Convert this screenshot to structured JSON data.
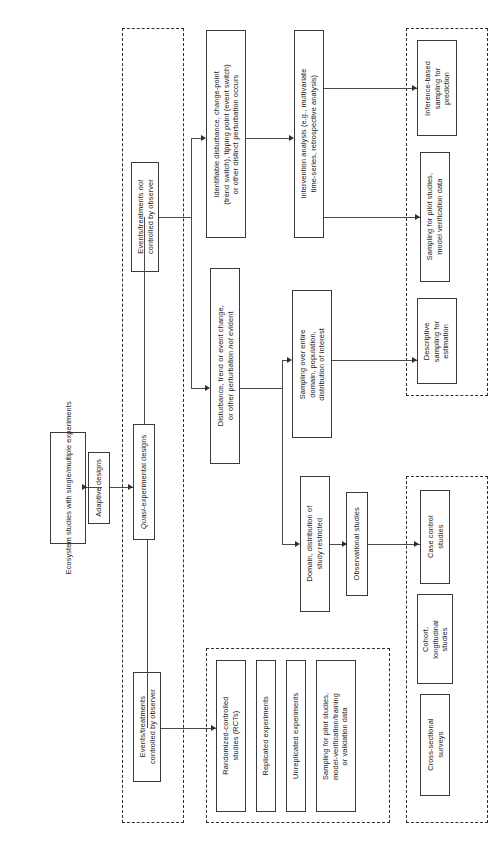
{
  "diagram": {
    "orientation": "rotated-90",
    "line_color": "#4a4a4a",
    "box_border_color": "#3a3a3a",
    "group_border_color": "#2e2e2e",
    "background": "#ffffff"
  },
  "nodes": {
    "start": "Ecosystem studies with single/multiple experiments",
    "adaptive": "Adaptive designs",
    "quasi_pre": "Quasi",
    "quasi_post": "-experimental designs",
    "events_not_controlled_l1": "Events/treatments ",
    "events_not_controlled_it": "not",
    "events_not_controlled_l2": "controlled by observer",
    "events_controlled_l1": "Events/treatments",
    "events_controlled_l2": "controlled by observer",
    "identifiable_l1": "Identifiable disturbance, change-point",
    "identifiable_l2": "(trend switch), tipping point (event switch)",
    "identifiable_l3": "or other distinct perturbation occurs",
    "disturbance_l1": "Disturbance, trend or event change,",
    "disturbance_l2a": "or other perturbation ",
    "disturbance_l2_it": "not",
    "disturbance_l2b": " evident",
    "domain_restricted_l1": "Domain, distribution of",
    "domain_restricted_l2": "study restricted",
    "intervention_l1": "Intervention analysis (e.g., multivariate",
    "intervention_l2": "time-series, retrospective analysis)",
    "sampling_entire_l1": "Sampling over entire",
    "sampling_entire_l2": "domain, population,",
    "sampling_entire_l3": "distribution of interest",
    "observational": "Observational studies",
    "inference_l1": "Inference-based",
    "inference_l2": "sampling for",
    "inference_l3": "prediction",
    "pilot_model_l1": "Sampling for pilot studies,",
    "pilot_model_l2": "model verification data",
    "descriptive_l1": "Descriptive",
    "descriptive_l2": "sampling for",
    "descriptive_l3": "estimation",
    "case_control_l1": "Case control",
    "case_control_l2": "studies",
    "cohort_l1": "Cohort,",
    "cohort_l2": "longitudinal",
    "cohort_l3": "studies",
    "cross_sectional_l1": "Cross-sectional",
    "cross_sectional_l2": "surveys",
    "rct_l1": "Randomized-controlled",
    "rct_l2": "studies (RCTs)",
    "replicated": "Replicated experiments",
    "unreplicated": "Unreplicated experiments",
    "pilot_training_l1": "Sampling for pilot studies,",
    "pilot_training_l2": "model-verification/training",
    "pilot_training_l3": "or validation data"
  }
}
